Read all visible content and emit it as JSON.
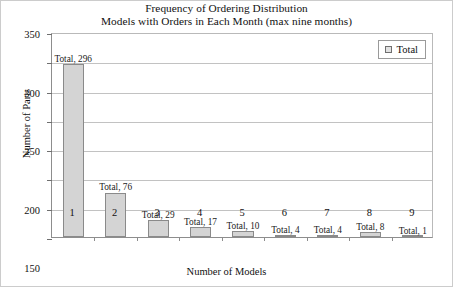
{
  "chart_data": {
    "type": "bar",
    "title": "Frequency of Ordering Distribution",
    "subtitle": "Models with Orders in Each Month (max nine months)",
    "xlabel": "Number of Models",
    "ylabel": "Number of Parts",
    "categories": [
      "1",
      "2",
      "3",
      "4",
      "5",
      "6",
      "7",
      "8",
      "9"
    ],
    "values": [
      296,
      76,
      29,
      17,
      10,
      4,
      4,
      8,
      1
    ],
    "point_labels": [
      "Total, 296",
      "Total, 76",
      "Total, 29",
      "Total, 17",
      "Total, 10",
      "Total, 4",
      "Total, 4",
      "Total, 8",
      "Total, 1"
    ],
    "series": [
      {
        "name": "Total",
        "values": [
          296,
          76,
          29,
          17,
          10,
          4,
          4,
          8,
          1
        ]
      }
    ],
    "ylim": [
      0,
      350
    ],
    "yticks": [
      0,
      50,
      100,
      150,
      200,
      250,
      300,
      350
    ],
    "ytick_labels": [
      "0",
      "50",
      "100",
      "150",
      "200",
      "250",
      "300",
      "350"
    ],
    "grid": true,
    "grid_axis": "y",
    "legend": {
      "position": "top-right",
      "entries": [
        "Total"
      ]
    },
    "colors": {
      "bar_fill": "#d4d4d4",
      "bar_border": "#8a8a8a",
      "grid": "#c2c2c2",
      "axis": "#8d8d8d",
      "text": "#111111",
      "background": "#ffffff"
    }
  }
}
